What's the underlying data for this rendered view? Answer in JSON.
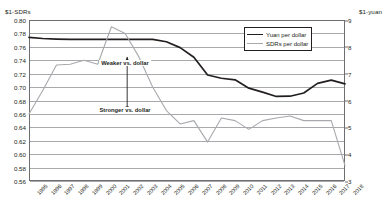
{
  "chart_data": {
    "type": "line",
    "title": "",
    "subtitle": "",
    "xlabel": "",
    "ylabel": "$1-SDRs",
    "y2label": "$1-yuan",
    "grid": true,
    "legend_position": "top-right",
    "x": [
      1995,
      1996,
      1997,
      1998,
      1999,
      2000,
      2001,
      2002,
      2003,
      2004,
      2005,
      2006,
      2007,
      2008,
      2009,
      2010,
      2011,
      2012,
      2013,
      2014,
      2015,
      2016,
      2017,
      2018
    ],
    "xticklabels": [
      "1995",
      "1996",
      "1997",
      "1998",
      "1999",
      "2000",
      "2001",
      "2002",
      "2003",
      "2004",
      "2005",
      "2006",
      "2007",
      "2008",
      "2009",
      "2010",
      "2011",
      "2012",
      "2013",
      "2014",
      "2015",
      "2016",
      "2017",
      "2018"
    ],
    "ylim": [
      0.56,
      0.8
    ],
    "yticks": [
      0.56,
      0.58,
      0.6,
      0.62,
      0.64,
      0.66,
      0.68,
      0.7,
      0.72,
      0.74,
      0.76,
      0.78,
      0.8
    ],
    "yticklabels": [
      "0.56",
      "0.58",
      "0.60",
      "0.62",
      "0.64",
      "0.66",
      "0.68",
      "0.70",
      "0.72",
      "0.74",
      "0.76",
      "0.78",
      "0.80"
    ],
    "y2lim": [
      3,
      9
    ],
    "y2ticks": [
      3,
      4,
      5,
      6,
      7,
      8,
      9
    ],
    "y2ticklabels": [
      "3",
      "4",
      "5",
      "6",
      "7",
      "8",
      "9"
    ],
    "series": [
      {
        "name": "Yuan per dollar",
        "axis": "right",
        "color": "#231f20",
        "width": 1.7,
        "values": [
          8.35,
          8.31,
          8.29,
          8.28,
          8.28,
          8.28,
          8.28,
          8.28,
          8.28,
          8.28,
          8.19,
          7.97,
          7.61,
          6.95,
          6.83,
          6.77,
          6.46,
          6.31,
          6.15,
          6.16,
          6.28,
          6.64,
          6.76,
          6.62
        ]
      },
      {
        "name": "SDRs per dollar",
        "axis": "left",
        "color": "#a7a9ac",
        "width": 1.1,
        "values": [
          0.66,
          0.695,
          0.733,
          0.734,
          0.74,
          0.734,
          0.79,
          0.78,
          0.745,
          0.7,
          0.665,
          0.645,
          0.65,
          0.618,
          0.654,
          0.65,
          0.637,
          0.65,
          0.654,
          0.657,
          0.65,
          0.65,
          0.65,
          0.583
        ]
      }
    ],
    "annotations": [
      {
        "name": "weaker",
        "text": "Weaker vs. dollar",
        "x": 2002,
        "position": "upper"
      },
      {
        "name": "stronger",
        "text": "Stronger vs. dollar",
        "x": 2002,
        "position": "lower"
      },
      {
        "name": "direction-arrow",
        "text": "",
        "type": "double-headed-vertical-arrow"
      }
    ]
  },
  "legend": {
    "entries": [
      {
        "label": "Yuan per dollar",
        "color": "#231f20"
      },
      {
        "label": "SDRs per dollar",
        "color": "#a7a9ac"
      }
    ]
  }
}
